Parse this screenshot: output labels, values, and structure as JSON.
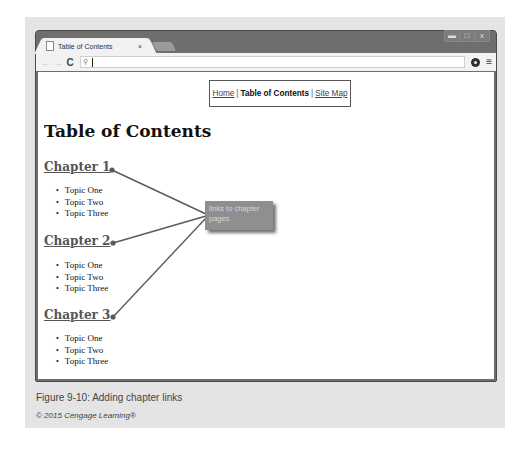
{
  "browser": {
    "tab": {
      "title": "Table of Contents",
      "close": "×"
    },
    "window_controls": {
      "minimize": "▬",
      "maximize": "□",
      "close": "x"
    },
    "toolbar": {
      "back": "←",
      "forward": "→",
      "reload": "C",
      "search_icon": "🔍",
      "address_value": "",
      "menu": "≡"
    }
  },
  "page": {
    "nav": {
      "home": "Home",
      "sep1": "|",
      "current": "Table of Contents",
      "sep2": "|",
      "sitemap": "Site Map"
    },
    "title": "Table of Contents",
    "chapters": [
      {
        "label": "Chapter 1",
        "topics": [
          "Topic One",
          "Topic Two",
          "Topic Three"
        ]
      },
      {
        "label": "Chapter 2",
        "topics": [
          "Topic One",
          "Topic Two",
          "Topic Three"
        ]
      },
      {
        "label": "Chapter 3",
        "topics": [
          "Topic One",
          "Topic Two",
          "Topic Three"
        ]
      }
    ]
  },
  "callout": {
    "text": "links to chapter pages",
    "color": "#8f8f8f"
  },
  "figure": {
    "caption": "Figure 9-10: Adding chapter links",
    "copyright": "© 2015 Cengage Learning®"
  }
}
